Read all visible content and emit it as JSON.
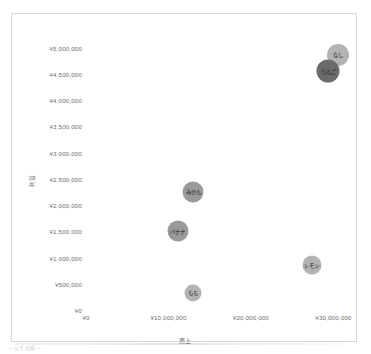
{
  "caption": "— 以下凡例 —",
  "axes": {
    "x_title": "売上",
    "y_title": "利益",
    "x_ticks": [
      "¥0",
      "¥10,000,000",
      "¥20,000,000",
      "¥30,000,000"
    ],
    "y_ticks": [
      "¥5,000,000",
      "¥4,500,000",
      "¥4,000,000",
      "¥3,500,000",
      "¥3,000,000",
      "¥2,500,000",
      "¥2,000,000",
      "¥1,500,000",
      "¥1,000,000",
      "¥500,000",
      "¥0"
    ]
  },
  "colors": {
    "bubble_light": "#b3b3b3",
    "bubble_medium": "#9a9a9a",
    "bubble_dark": "#6b6b6b",
    "frame_border": "#d8d8d8",
    "tick_text": "#6e6e6e",
    "axis_title_text": "#707070",
    "background": "#ffffff"
  },
  "chart_data": {
    "type": "scatter",
    "title": "",
    "xlabel": "売上",
    "ylabel": "利益",
    "xlim": [
      0,
      32500000
    ],
    "ylim": [
      0,
      5200000
    ],
    "grid": false,
    "legend": "none",
    "points": [
      {
        "label": "なし",
        "x": 30600000,
        "y": 4850000,
        "size": 22,
        "color": "#b3b3b3"
      },
      {
        "label": "りんご",
        "x": 29400000,
        "y": 4550000,
        "size": 23,
        "color": "#6b6b6b"
      },
      {
        "label": "みかん",
        "x": 13000000,
        "y": 2250000,
        "size": 21,
        "color": "#9a9a9a"
      },
      {
        "label": "バナナ",
        "x": 11100000,
        "y": 1500000,
        "size": 21,
        "color": "#9a9a9a"
      },
      {
        "label": "レモン",
        "x": 27400000,
        "y": 850000,
        "size": 19,
        "color": "#b3b3b3"
      },
      {
        "label": "もも",
        "x": 13000000,
        "y": 330000,
        "size": 17,
        "color": "#b3b3b3"
      }
    ]
  }
}
